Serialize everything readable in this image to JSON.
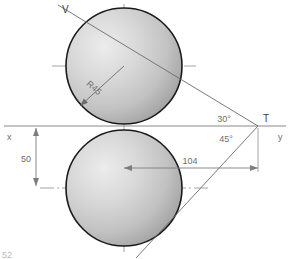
{
  "drawing": {
    "title": "Two tangent circles with angled construction lines",
    "background_color": "#ffffff",
    "colors": {
      "circle_outline": "#1a1a1a",
      "circle_fill_light": "#e2e2e2",
      "circle_fill_mid": "#c3c3c3",
      "circle_fill_dark": "#9b9b9b",
      "construction_line": "#6b6b6b",
      "axis_line": "#8a8a8a",
      "center_line": "#7a7a7a",
      "dimension_line": "#7d7d7d",
      "text_light": "#6e6e6e",
      "text_dark": "#3a3a3a",
      "text_faint": "#b9b9b9"
    },
    "axes": {
      "x_label": "x",
      "y_label": "y",
      "axis_y_position": 126
    },
    "points": [
      {
        "name": "T",
        "label": "T",
        "x": 258,
        "y": 126
      },
      {
        "name": "V",
        "label": "V",
        "x": 66,
        "y": 9
      }
    ],
    "circles": [
      {
        "name": "upper-circle",
        "center_x": 124,
        "center_y": 66,
        "radius": 58,
        "radius_label": "R45"
      },
      {
        "name": "lower-circle",
        "center_x": 124,
        "center_y": 188,
        "radius": 58,
        "radius_label": ""
      }
    ],
    "dimensions": [
      {
        "name": "vertical-50",
        "label": "50",
        "value": 50,
        "orientation": "vertical"
      },
      {
        "name": "horizontal-104",
        "label": "104",
        "value": 104,
        "orientation": "horizontal"
      },
      {
        "name": "radius-upper",
        "label": "R45",
        "value": 45,
        "orientation": "radial"
      }
    ],
    "angles": [
      {
        "name": "angle-30",
        "label": "30°",
        "value": 30
      },
      {
        "name": "angle-45",
        "label": "45°",
        "value": 45
      }
    ],
    "clipped_note": "52"
  }
}
